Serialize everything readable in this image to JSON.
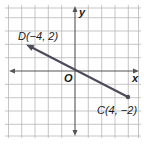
{
  "figure": {
    "type": "coordinate-plane",
    "x_axis_label": "x",
    "y_axis_label": "y",
    "origin_label": "O",
    "grid": {
      "x_min": -5,
      "x_max": 5,
      "y_min": -5,
      "y_max": 5
    },
    "points": [
      {
        "name": "D",
        "label": "D(−4, 2)",
        "x": -4,
        "y": 2,
        "marker": "arrow"
      },
      {
        "name": "C",
        "label": "C(4, −2)",
        "x": 4,
        "y": -2,
        "marker": "dot"
      }
    ],
    "colors": {
      "grid": "#b8b8b8",
      "axes": "#555555",
      "line": "#4a4a58",
      "background": "#ffffff"
    }
  }
}
